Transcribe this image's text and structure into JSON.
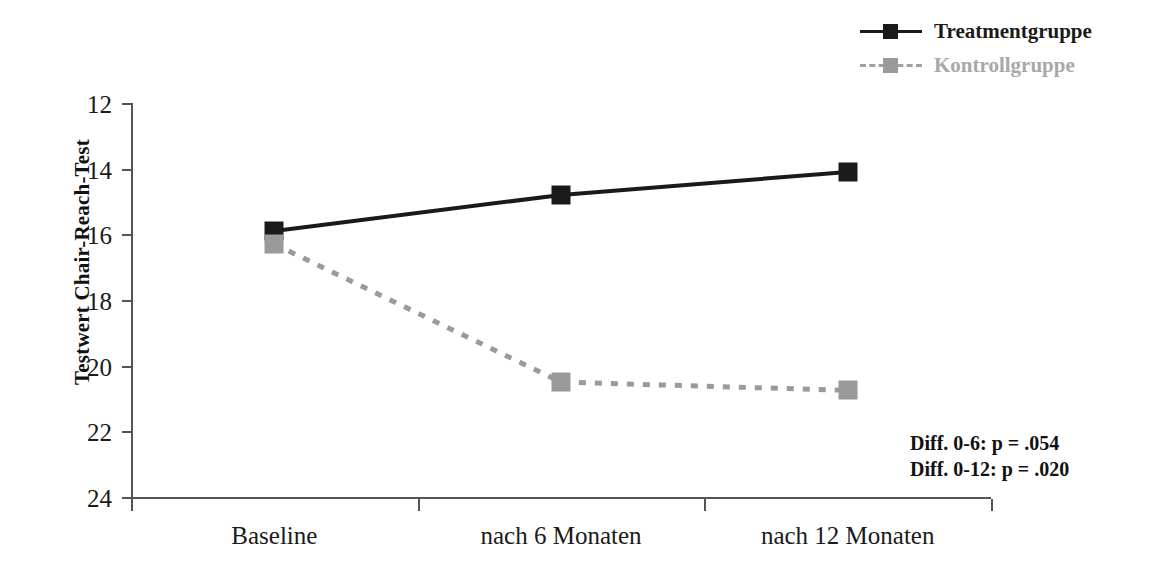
{
  "chart_data": {
    "type": "line",
    "title": "",
    "xlabel": "",
    "ylabel": "Testwert Chair-Reach-Test",
    "categories": [
      "Baseline",
      "nach 6 Monaten",
      "nach 12 Monaten"
    ],
    "ylim": [
      12,
      24
    ],
    "y_axis_inverted": true,
    "yticks": [
      12,
      14,
      16,
      18,
      20,
      22,
      24
    ],
    "grid": false,
    "legend_position": "top-right",
    "series": [
      {
        "name": "Treatmentgruppe",
        "values": [
          15.9,
          14.8,
          14.1
        ],
        "color": "#1a1a1a",
        "line_style": "solid",
        "marker": "square"
      },
      {
        "name": "Kontrollgruppe",
        "values": [
          16.3,
          20.5,
          20.75
        ],
        "color": "#9a9a9a",
        "line_style": "dashed",
        "marker": "square"
      }
    ],
    "annotations": [
      "Diff. 0-6:   p = .054",
      "Diff. 0-12: p = .020"
    ]
  },
  "legend": {
    "items": [
      {
        "label": "Treatmentgruppe"
      },
      {
        "label": "Kontrollgruppe"
      }
    ]
  },
  "axis": {
    "y_title": "Testwert Chair-Reach-Test",
    "y_tick_labels": [
      "12",
      "14",
      "16",
      "18",
      "20",
      "22",
      "24"
    ],
    "x_tick_labels": [
      "Baseline",
      "nach 6 Monaten",
      "nach 12 Monaten"
    ]
  },
  "annotations": {
    "line1": "Diff. 0-6:   p = .054",
    "line2": "Diff. 0-12: p = .020"
  },
  "colors": {
    "treatment": "#1a1a1a",
    "control": "#9a9a9a",
    "axis": "#555555",
    "background": "#ffffff"
  }
}
